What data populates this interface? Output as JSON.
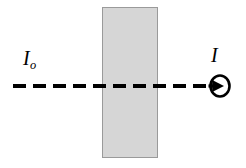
{
  "figure": {
    "name": "light-attenuation-through-slab",
    "background_color": "#ffffff",
    "width": 246,
    "height": 168
  },
  "slab": {
    "name": "absorbing-slab",
    "fill_color": "#d6d6d6",
    "stroke_color": "#9a9a9a",
    "x": 102,
    "y": 7,
    "width": 56,
    "height": 151
  },
  "beam": {
    "name": "light-beam-dashed-line",
    "color": "#000000",
    "thickness": 4,
    "dash_length": 13,
    "gap_length": 7,
    "y": 86,
    "x_start": 13,
    "x_end": 209
  },
  "detector": {
    "name": "detector-circle",
    "stroke_color": "#000000",
    "fill_color": "#ffffff",
    "center_x": 220,
    "center_y": 86,
    "radius_x": 10,
    "radius_y": 11,
    "arrow_color": "#000000"
  },
  "labels": {
    "incident": {
      "symbol": "I",
      "subscript": "o",
      "full": "Io",
      "meaning": "incident-intensity"
    },
    "transmitted": {
      "symbol": "I",
      "subscript": "",
      "full": "I",
      "meaning": "transmitted-intensity"
    }
  }
}
